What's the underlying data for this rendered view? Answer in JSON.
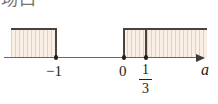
{
  "heading": {
    "clipped_text": "场口"
  },
  "figure": {
    "axis_label": "a",
    "axis_arrow_direction": "right",
    "shading_color": "#f9efe4",
    "border_color": "#4a423e",
    "axis_color": "#6d6762",
    "point_color": "#221e1b",
    "tick_labels": [
      {
        "text": "−1",
        "x": 56
      },
      {
        "text": "0",
        "x": 124
      }
    ],
    "fraction_label": {
      "numerator": "1",
      "denominator": "3",
      "x": 146
    },
    "solid_points": [
      {
        "label": "−1",
        "x": 56
      },
      {
        "label": "0",
        "x": 124
      },
      {
        "label": "1/3",
        "x": 146
      }
    ],
    "regions": [
      {
        "name": "left-shaded-region",
        "from": "-infinity",
        "to": "-1",
        "left": 11,
        "right": 57
      },
      {
        "name": "right-shaded-region",
        "from": "0",
        "to": "+infinity",
        "left": 123,
        "right": 207
      }
    ]
  }
}
